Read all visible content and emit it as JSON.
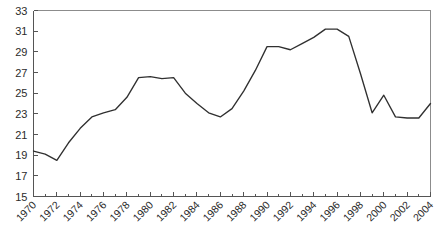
{
  "chart_data": {
    "type": "line",
    "title": "",
    "subtitle": "",
    "xlabel": "",
    "ylabel": "",
    "grid": false,
    "legend": false,
    "legend_position": "none",
    "xlim": [
      1970,
      2004
    ],
    "ylim": [
      15,
      33
    ],
    "ytick_step": 2,
    "xtick_step": 2,
    "xtick_minor_step": 1,
    "line_color": "#303030",
    "axis_color": "#555555",
    "frame_color": "#8c8c8c",
    "background_color": "#ffffff",
    "y_ticks": [
      15,
      17,
      19,
      21,
      23,
      25,
      27,
      29,
      31,
      33
    ],
    "y_tick_labels": [
      "15",
      "17",
      "19",
      "21",
      "23",
      "25",
      "27",
      "29",
      "31",
      "33"
    ],
    "x_ticks": [
      1970,
      1972,
      1974,
      1976,
      1978,
      1980,
      1982,
      1984,
      1986,
      1988,
      1990,
      1992,
      1994,
      1996,
      1998,
      2000,
      2002,
      2004
    ],
    "x_tick_labels": [
      "1970",
      "1972",
      "1974",
      "1976",
      "1978",
      "1980",
      "1982",
      "1984",
      "1986",
      "1988",
      "1990",
      "1992",
      "1994",
      "1996",
      "1998",
      "2000",
      "2002",
      "2004"
    ],
    "x": [
      1970,
      1971,
      1972,
      1973,
      1974,
      1975,
      1976,
      1977,
      1978,
      1979,
      1980,
      1981,
      1982,
      1983,
      1984,
      1985,
      1986,
      1987,
      1988,
      1989,
      1990,
      1991,
      1992,
      1993,
      1994,
      1995,
      1996,
      1997,
      1998,
      1999,
      2000,
      2001,
      2002,
      2003,
      2004
    ],
    "values": [
      19.4,
      19.1,
      18.5,
      20.2,
      21.6,
      22.7,
      23.1,
      23.4,
      24.6,
      26.5,
      26.6,
      26.4,
      26.5,
      25.0,
      24.0,
      23.1,
      22.7,
      23.5,
      25.2,
      27.2,
      29.5,
      29.5,
      29.2,
      29.8,
      30.4,
      31.2,
      31.2,
      30.5,
      26.9,
      23.1,
      24.8,
      22.7,
      22.6,
      22.6,
      24.0
    ]
  }
}
